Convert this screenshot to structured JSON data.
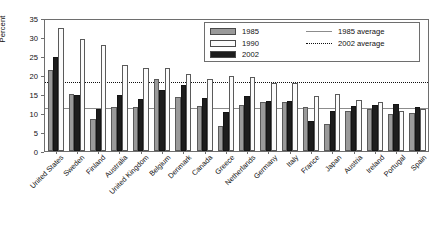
{
  "chart_data": {
    "type": "bar",
    "title": "",
    "xlabel": "",
    "ylabel": "Percent",
    "ylim": [
      0,
      35
    ],
    "yticks": [
      0,
      5,
      10,
      15,
      20,
      25,
      30,
      35
    ],
    "grid": false,
    "legend_position": "top-right",
    "categories": [
      "United States",
      "Sweden",
      "Finland",
      "Australia",
      "United Kingdom",
      "Belgium",
      "Denmark",
      "Canada",
      "Greece",
      "Netherlands",
      "Germany",
      "Italy",
      "France",
      "Japan",
      "Austria",
      "Ireland",
      "Portugal",
      "Spain"
    ],
    "series": [
      {
        "name": "1985",
        "color": "#9a9a9a",
        "values": [
          21.2,
          15.0,
          8.5,
          11.5,
          11.5,
          19.0,
          14.2,
          11.8,
          6.5,
          12.2,
          13.0,
          12.8,
          11.5,
          7.2,
          10.5,
          11.0,
          9.8,
          10.0
        ]
      },
      {
        "name": "2002",
        "color": "#1d1d1d",
        "values": [
          24.7,
          14.8,
          11.0,
          14.7,
          13.8,
          16.0,
          17.5,
          14.0,
          10.2,
          14.5,
          13.2,
          13.2,
          8.0,
          10.5,
          11.8,
          12.2,
          12.5,
          11.5
        ]
      },
      {
        "name": "1990",
        "color": "#fbfbfb",
        "values": [
          32.4,
          29.4,
          28.0,
          22.6,
          21.8,
          21.8,
          20.2,
          19.0,
          19.8,
          19.5,
          17.8,
          17.8,
          14.5,
          15.0,
          13.5,
          13.0,
          10.5,
          11.0
        ]
      }
    ],
    "reference_lines": [
      {
        "name": "1985 average",
        "value": 11.8,
        "style": "solid",
        "color": "#8c8c8c"
      },
      {
        "name": "2002 average",
        "value": 18.8,
        "style": "dotted",
        "color": "#111111"
      }
    ]
  },
  "legend": {
    "entries": [
      {
        "label": "1985",
        "swatch": "s1985"
      },
      {
        "label": "1990",
        "swatch": "s1990"
      },
      {
        "label": "2002",
        "swatch": "s2002"
      }
    ],
    "lines": [
      {
        "label": "1985 average",
        "style": "solid"
      },
      {
        "label": "2002 average",
        "style": "dotted"
      }
    ]
  }
}
